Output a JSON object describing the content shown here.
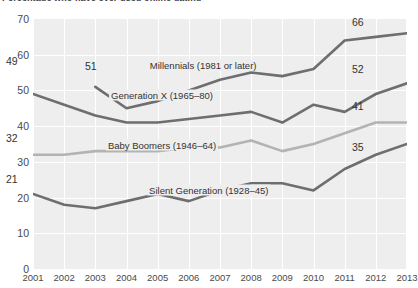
{
  "chart_data": {
    "type": "line",
    "title": "Percentage who have ever used online dating",
    "xlabel": "",
    "ylabel": "",
    "ylim": [
      0,
      70
    ],
    "yticks": [
      0,
      10,
      20,
      30,
      40,
      50,
      60,
      70
    ],
    "grid": true,
    "legend_position": "inline-on-lines",
    "categories": [
      "2001",
      "2002",
      "2003",
      "2004",
      "2005",
      "2006",
      "2007",
      "2008",
      "2009",
      "2010",
      "2011",
      "2012",
      "2013"
    ],
    "series": [
      {
        "name": "Millennials (1981 or later)",
        "label": "Millennials (1981 or later)",
        "color": "#6e6e6e",
        "start_label": "51",
        "end_label": "66",
        "x": [
          "2003",
          "2004",
          "2005",
          "2006",
          "2007",
          "2008",
          "2009",
          "2010",
          "2011",
          "2012",
          "2013"
        ],
        "values": [
          51,
          45,
          47,
          50,
          53,
          55,
          54,
          56,
          64,
          65,
          66
        ]
      },
      {
        "name": "Generation X (1965–80)",
        "label": "Generation X (1965–80)",
        "color": "#6e6e6e",
        "start_label": "49",
        "end_label": "52",
        "x": [
          "2001",
          "2002",
          "2003",
          "2004",
          "2005",
          "2006",
          "2007",
          "2008",
          "2009",
          "2010",
          "2011",
          "2012",
          "2013"
        ],
        "values": [
          49,
          46,
          43,
          41,
          41,
          42,
          43,
          44,
          41,
          46,
          44,
          49,
          52
        ]
      },
      {
        "name": "Baby Boomers (1946–64)",
        "label": "Baby Boomers (1946–64)",
        "color": "#b3b3b3",
        "start_label": "32",
        "end_label": "41",
        "x": [
          "2001",
          "2002",
          "2003",
          "2004",
          "2005",
          "2006",
          "2007",
          "2008",
          "2009",
          "2010",
          "2011",
          "2012",
          "2013"
        ],
        "values": [
          32,
          32,
          33,
          33,
          33,
          34,
          34,
          36,
          33,
          35,
          38,
          41,
          41
        ]
      },
      {
        "name": "Silent Generation (1928–45)",
        "label": "Silent Generation (1928–45)",
        "color": "#6e6e6e",
        "start_label": "21",
        "end_label": "35",
        "x": [
          "2001",
          "2002",
          "2003",
          "2004",
          "2005",
          "2006",
          "2007",
          "2008",
          "2009",
          "2010",
          "2011",
          "2012",
          "2013"
        ],
        "values": [
          21,
          18,
          17,
          19,
          21,
          19,
          22,
          24,
          24,
          22,
          28,
          32,
          35
        ]
      }
    ],
    "annotations": [
      {
        "text": "Millennials (1981 or later)",
        "x_frac": 0.455,
        "y_frac": 0.185
      },
      {
        "text": "Generation X (1965–80)",
        "x_frac": 0.345,
        "y_frac": 0.305
      },
      {
        "text": "Baby Boomers (1946–64)",
        "x_frac": 0.345,
        "y_frac": 0.505
      },
      {
        "text": "Silent Generation (1928–45)",
        "x_frac": 0.47,
        "y_frac": 0.685
      }
    ],
    "value_labels": [
      {
        "text": "49",
        "x": 6,
        "y": 55
      },
      {
        "text": "51",
        "x": 85,
        "y": 60
      },
      {
        "text": "32",
        "x": 6,
        "y": 132
      },
      {
        "text": "21",
        "x": 6,
        "y": 173
      },
      {
        "text": "66",
        "x": 352,
        "y": 16
      },
      {
        "text": "52",
        "x": 352,
        "y": 63
      },
      {
        "text": "41",
        "x": 352,
        "y": 100
      },
      {
        "text": "35",
        "x": 352,
        "y": 141
      }
    ]
  }
}
